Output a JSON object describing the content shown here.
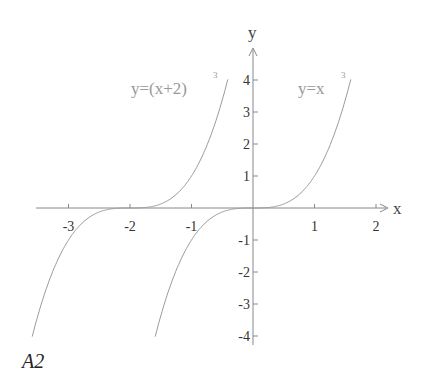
{
  "chart_data": {
    "type": "line",
    "title": "",
    "xlabel": "x",
    "ylabel": "y",
    "xlim": [
      -3.5,
      2.1
    ],
    "ylim": [
      -4,
      4.8
    ],
    "grid": false,
    "x_ticks": [
      -3,
      -2,
      -1,
      1,
      2
    ],
    "y_ticks": [
      4,
      3,
      2,
      1,
      -1,
      -2,
      -3,
      -4
    ],
    "series": [
      {
        "name": "y=(x+2)^3",
        "label_main": "y=(x+2)",
        "label_sup": "3",
        "shift": -2,
        "x_range": [
          -3.59,
          -0.41
        ]
      },
      {
        "name": "y=x^3",
        "label_main": "y=x",
        "label_sup": "3",
        "shift": 0,
        "x_range": [
          -1.59,
          1.59
        ]
      }
    ],
    "caption": "A2",
    "colors": {
      "curve": "#9a9a9a",
      "axis": "#888888",
      "text": "#333333"
    }
  }
}
